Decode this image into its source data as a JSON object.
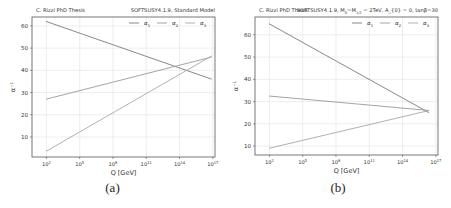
{
  "chart_data": [
    {
      "type": "line",
      "panel_caption": "(a)",
      "header_left": "C. Rizzi PhD Thesis",
      "title": "SOFTSUSY4.1.9, Standard Model",
      "xlabel": "Q [GeV]",
      "ylabel": "α⁻¹",
      "xscale": "log",
      "xlim_log10": [
        0.7,
        17.2
      ],
      "ylim": [
        1,
        64
      ],
      "x_ticks": [
        "10^2",
        "10^5",
        "10^8",
        "10^11",
        "10^14",
        "10^17"
      ],
      "x_tick_log10": [
        2,
        5,
        8,
        11,
        14,
        17
      ],
      "y_ticks": [
        10,
        20,
        30,
        40,
        50,
        60
      ],
      "grid": true,
      "legend_position": "upper right, horizontal",
      "series": [
        {
          "name": "α1",
          "log10_x": [
            1.96,
            16.9
          ],
          "values": [
            62,
            36
          ],
          "color": "#7a7a7a"
        },
        {
          "name": "α2",
          "log10_x": [
            1.96,
            16.9
          ],
          "values": [
            27,
            46
          ],
          "color": "#9a9a9a"
        },
        {
          "name": "α3",
          "log10_x": [
            1.96,
            16.9
          ],
          "values": [
            3.5,
            46.5
          ],
          "color": "#a8a8a8"
        }
      ]
    },
    {
      "type": "line",
      "panel_caption": "(b)",
      "header_left": "C. Rizzi PhD Thesis",
      "title": "SOFTSUSY4.1.9, M0=M1/2 = 2TeV, A_{0} = 0, tanβ=30",
      "title_parts": {
        "prefix": "SOFTSUSY4.1.9, M",
        "sub0": "0",
        "mid": "=M",
        "sub12": "1/2",
        "suffix": " = 2TeV, A_{0} = 0, tanβ=30"
      },
      "xlabel": "Q [GeV]",
      "ylabel": "α⁻¹",
      "xscale": "log",
      "xlim_log10": [
        0.7,
        17.2
      ],
      "ylim": [
        6,
        68
      ],
      "x_ticks": [
        "10^2",
        "10^5",
        "10^8",
        "10^11",
        "10^14",
        "10^17"
      ],
      "x_tick_log10": [
        2,
        5,
        8,
        11,
        14,
        17
      ],
      "y_ticks": [
        10,
        20,
        30,
        40,
        50,
        60
      ],
      "grid": true,
      "legend_position": "upper right, horizontal",
      "series": [
        {
          "name": "α1",
          "log10_x": [
            1.96,
            16.4
          ],
          "values": [
            65,
            25
          ],
          "color": "#7a7a7a"
        },
        {
          "name": "α2",
          "log10_x": [
            1.96,
            16.4
          ],
          "values": [
            32.5,
            26
          ],
          "color": "#9a9a9a"
        },
        {
          "name": "α3",
          "log10_x": [
            1.96,
            16.4
          ],
          "values": [
            9,
            26
          ],
          "color": "#a8a8a8"
        }
      ]
    }
  ]
}
